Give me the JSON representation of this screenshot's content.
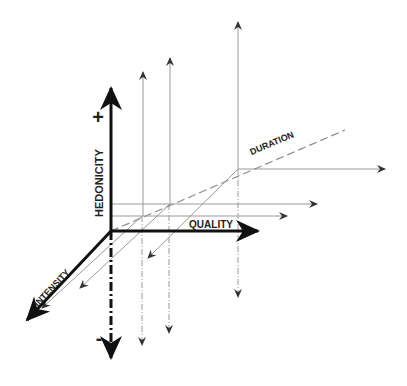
{
  "diagram": {
    "type": "3d-axes-hedonic-space",
    "axes": {
      "hedonicity": {
        "label": "HEDONICITY",
        "positive": "+",
        "negative": "-"
      },
      "quality": {
        "label": "QUALITY"
      },
      "intensity": {
        "label": "INTENSITY"
      },
      "duration": {
        "label": "DURATION"
      }
    },
    "colors": {
      "main_axis": "#111111",
      "guide_line": "#9a9a9a",
      "guide_arrow": "#333333",
      "background": "#ffffff"
    },
    "guide_points": [
      {
        "x": 142,
        "y": 216
      },
      {
        "x": 170,
        "y": 204
      },
      {
        "x": 238,
        "y": 169
      }
    ]
  }
}
